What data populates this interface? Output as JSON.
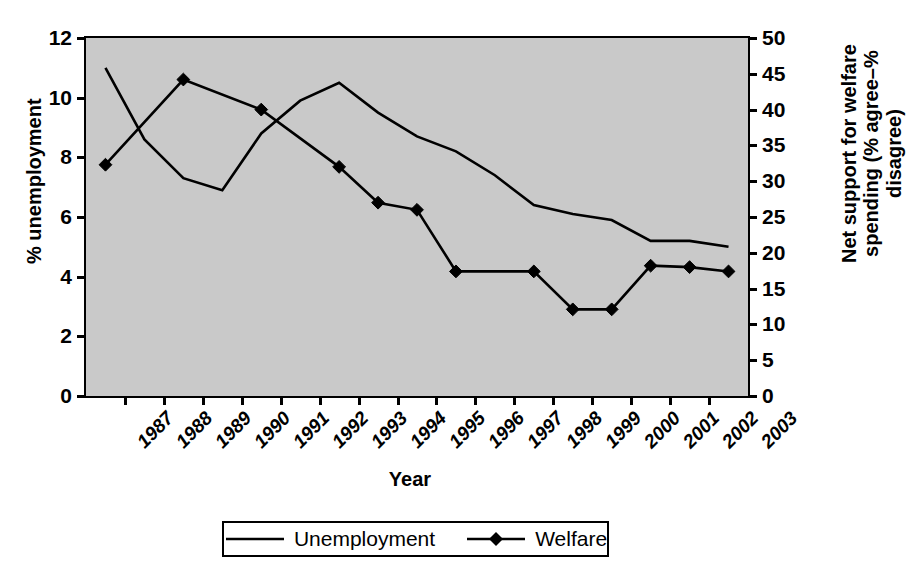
{
  "chart_data": {
    "type": "line",
    "title": "",
    "xlabel": "Year",
    "ylabel": "% unemployment",
    "y2label": "Net support for welfare spending (% agree–% disagree)",
    "categories": [
      "1987",
      "1988",
      "1989",
      "1990",
      "1991",
      "1992",
      "1993",
      "1994",
      "1995",
      "1996",
      "1997",
      "1998",
      "1999",
      "2000",
      "2001",
      "2002",
      "2003"
    ],
    "ylim": [
      0,
      12
    ],
    "yticks": [
      0,
      2,
      4,
      6,
      8,
      10,
      12
    ],
    "y2lim": [
      0,
      50
    ],
    "y2ticks": [
      0,
      5,
      10,
      15,
      20,
      25,
      30,
      35,
      40,
      45,
      50
    ],
    "grid": false,
    "legend_position": "bottom",
    "series": [
      {
        "name": "Unemployment",
        "axis": "left",
        "marker": "none",
        "x": [
          "1987",
          "1988",
          "1989",
          "1990",
          "1991",
          "1992",
          "1993",
          "1994",
          "1995",
          "1996",
          "1997",
          "1998",
          "1999",
          "2000",
          "2001",
          "2002",
          "2003"
        ],
        "values": [
          11.0,
          8.6,
          7.3,
          6.9,
          8.8,
          9.9,
          10.5,
          9.5,
          8.7,
          8.2,
          7.4,
          6.4,
          6.1,
          5.9,
          5.2,
          5.2,
          5.0
        ]
      },
      {
        "name": "Welfare",
        "axis": "right",
        "marker": "diamond",
        "x": [
          "1987",
          "1989",
          "1991",
          "1993",
          "1994",
          "1995",
          "1996",
          "1998",
          "1999",
          "2000",
          "2001",
          "2002",
          "2003"
        ],
        "values": [
          32.3,
          44.2,
          40.0,
          32.0,
          27.0,
          26.0,
          17.4,
          17.4,
          12.1,
          12.1,
          18.2,
          18.0,
          17.4
        ]
      }
    ]
  },
  "legend": {
    "entries": [
      {
        "label": "Unemployment",
        "marker": "none"
      },
      {
        "label": "Welfare",
        "marker": "diamond"
      }
    ]
  },
  "colors": {
    "plot_background": "#c9c9c9",
    "page_background": "#ffffff",
    "line": "#000000",
    "axis": "#000000"
  }
}
